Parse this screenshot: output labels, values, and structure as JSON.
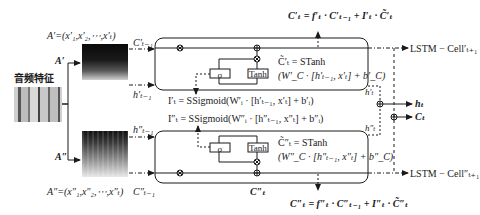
{
  "title_cn": "音频特征",
  "inputs": {
    "forward": {
      "sequence": "A′=(x′₁,x′₂,⋯,x′ₜ)",
      "label": "A′",
      "c_prev": "C′ₜ₋₁",
      "h_prev": "h′ₜ₋₁"
    },
    "backward": {
      "sequence": "A″=(x″₁,x″₂,⋯,x″ₜ)",
      "label": "A″",
      "h_prev": "h″ₜ₋₁",
      "c_prev": "C″ₜ₋₁"
    }
  },
  "forward_cell": {
    "cell_state_eq": "C′ₜ = f′ₜ · C′ₜ₋₁ + I′ₜ · C̃′ₜ",
    "input_gate_eq": "I′ₜ = SSigmoid(W′ᵢ · [h′ₜ₋₁, x′ₜ] + b′ᵢ)",
    "candidate_eq_1": "C̃′ₜ = STanh",
    "candidate_eq_2": "(W′_C · [h′ₜ₋₁, x′ₜ] + b′_C)",
    "sigma_label": "σ",
    "tanh_label": "Tanh",
    "h_out": "h′ₜ",
    "next_cell": "LSTM − Cell′ₜ₊₁"
  },
  "backward_cell": {
    "input_gate_eq": "I″ₜ = SSigmoid(W″ᵢ · [h″ₜ₋₁, x″ₜ] + b″ᵢ)",
    "candidate_eq_1": "C̃″ₜ = STanh",
    "candidate_eq_2": "(W″_C · [h″ₜ₋₁, x″ₜ] + b″_C)",
    "sigma_label": "σ",
    "tanh_label": "Tanh",
    "h_out": "h″ₜ",
    "c_out": "C″ₜ",
    "cell_state_eq": "C″ₜ = f″ₜ · C″ₜ₋₁ + I″ₜ · C̃″ₜ",
    "next_cell": "LSTM − Cell″ₜ₊₁"
  },
  "outputs": {
    "h": "hₜ",
    "c": "Cₜ"
  },
  "colors": {
    "line": "#1a1a1a",
    "background": "#ffffff"
  }
}
